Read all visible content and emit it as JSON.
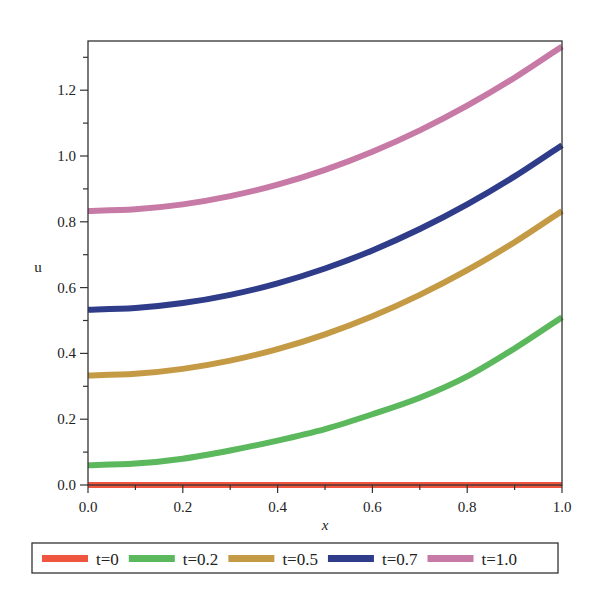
{
  "chart_data": {
    "type": "line",
    "title": "",
    "xlabel": "x",
    "ylabel": "u",
    "xlim": [
      0,
      1.0
    ],
    "ylim": [
      -0.015,
      1.35
    ],
    "grid": false,
    "legend_position": "bottom",
    "x_ticks": [
      "0.0",
      "0.2",
      "0.4",
      "0.6",
      "0.8",
      "1.0"
    ],
    "y_ticks": [
      "0.0",
      "0.2",
      "0.4",
      "0.6",
      "0.8",
      "1.0",
      "1.2"
    ],
    "x": [
      0,
      0.1,
      0.2,
      0.3,
      0.4,
      0.5,
      0.6,
      0.7,
      0.8,
      0.9,
      1.0
    ],
    "series": [
      {
        "name": "t=0",
        "color": "#f0563f",
        "values": [
          0,
          0,
          0,
          0,
          0,
          0,
          0,
          0,
          0,
          0,
          0
        ]
      },
      {
        "name": "t=0.2",
        "color": "#5cb85c",
        "values": [
          0.06,
          0.065,
          0.08,
          0.105,
          0.135,
          0.17,
          0.215,
          0.265,
          0.33,
          0.415,
          0.51
        ]
      },
      {
        "name": "t=0.5",
        "color": "#c49a45",
        "values": [
          0.333,
          0.338,
          0.353,
          0.378,
          0.413,
          0.458,
          0.513,
          0.578,
          0.653,
          0.738,
          0.833
        ]
      },
      {
        "name": "t=0.7",
        "color": "#2e3c8a",
        "values": [
          0.533,
          0.538,
          0.553,
          0.578,
          0.613,
          0.658,
          0.713,
          0.778,
          0.853,
          0.938,
          1.033
        ]
      },
      {
        "name": "t=1.0",
        "color": "#c77aa6",
        "values": [
          0.833,
          0.838,
          0.853,
          0.878,
          0.913,
          0.958,
          1.013,
          1.078,
          1.153,
          1.238,
          1.333
        ]
      }
    ]
  }
}
